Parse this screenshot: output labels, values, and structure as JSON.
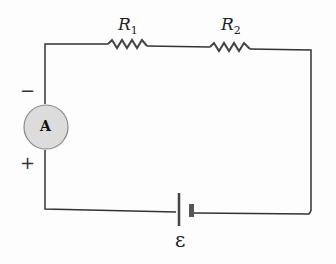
{
  "diagram": {
    "type": "series circuit",
    "resistors": [
      {
        "label": "R",
        "subscript": "1"
      },
      {
        "label": "R",
        "subscript": "2"
      }
    ],
    "ammeter": {
      "label": "A",
      "negative_terminal": "−",
      "positive_terminal": "+"
    },
    "battery": {
      "label": "ε"
    },
    "colors": {
      "wire": "#333333",
      "ammeter_fill": "#dcdcdc",
      "ammeter_stroke": "#888888"
    }
  }
}
